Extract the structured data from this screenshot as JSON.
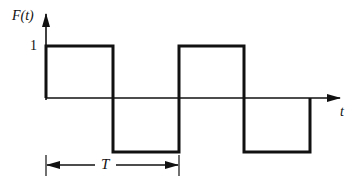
{
  "diagram": {
    "type": "square-wave",
    "y_axis_label": "F(t)",
    "x_axis_label": "t",
    "y_tick_label": "1",
    "period_label": "T",
    "colors": {
      "line": "#111111",
      "background": "#ffffff"
    },
    "levels": {
      "high": 1,
      "low": -1
    },
    "transitions_px": [
      46,
      113,
      179,
      244,
      310
    ],
    "segments": [
      {
        "from": 0,
        "to": 0.5,
        "value": 1
      },
      {
        "from": 0.5,
        "to": 1.0,
        "value": -1
      },
      {
        "from": 1.0,
        "to": 1.5,
        "value": 1
      },
      {
        "from": 1.5,
        "to": 2.0,
        "value": -1
      }
    ]
  }
}
